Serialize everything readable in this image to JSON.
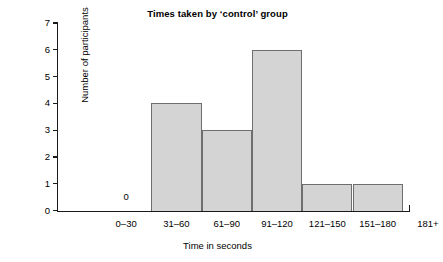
{
  "chart_data": {
    "type": "bar",
    "title": "Times taken by ‘control’ group",
    "xlabel": "Time in seconds",
    "ylabel": "Number of participants",
    "categories": [
      "0–30",
      "31–60",
      "61–90",
      "91–120",
      "121–150",
      "151–180",
      "181+"
    ],
    "values": [
      0,
      4,
      3,
      6,
      1,
      1,
      0
    ],
    "ylim": [
      0,
      7
    ],
    "yticks": [
      "0",
      "1",
      "2",
      "3",
      "4",
      "5",
      "6",
      "7"
    ],
    "grid": false,
    "legend": false,
    "annotations": [
      {
        "text": "0",
        "category": "0–30",
        "value": 0,
        "note": "zero-count label drawn inside the first empty bin"
      }
    ],
    "colors": {
      "bar_fill": "#d4d4d4",
      "bar_edge": "#6e6e6e",
      "axis": "#1a1a1a",
      "text": "#000000",
      "background": "#ffffff"
    }
  }
}
